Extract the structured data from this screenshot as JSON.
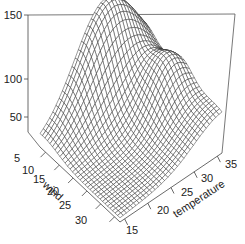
{
  "chart_data": {
    "type": "surface3d",
    "title": "",
    "xlabel": "wind",
    "ylabel": "temperature",
    "zlabel": "",
    "x_ticks": [
      5,
      10,
      15,
      20,
      25,
      30
    ],
    "y_ticks": [
      15,
      20,
      25,
      30,
      35
    ],
    "z_ticks": [
      50,
      100,
      150
    ],
    "xlim": [
      3,
      32
    ],
    "ylim": [
      14,
      36
    ],
    "zlim": [
      20,
      150
    ],
    "grid_lines": 32
  },
  "axes": {
    "z_tick_labels": [
      "150",
      "100",
      "50"
    ],
    "wind_tick_labels": [
      "5",
      "10",
      "15",
      "20",
      "25",
      "30"
    ],
    "temp_tick_labels": [
      "15",
      "20",
      "25",
      "30",
      "35"
    ],
    "wind_title": "wind",
    "temp_title": "temperature"
  }
}
